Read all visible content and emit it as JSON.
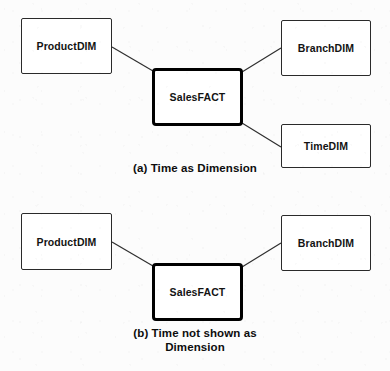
{
  "figure": {
    "background_color": "#fcfcfc",
    "line_color": "#2a2a2a",
    "fact_border_color": "#000000",
    "text_color": "#131313"
  },
  "panels": [
    {
      "id": "panel-a",
      "caption_lines": [
        "(a) Time as Dimension"
      ],
      "nodes": [
        {
          "id": "a-product",
          "label": "ProductDIM",
          "type": "dimension"
        },
        {
          "id": "a-sales",
          "label": "SalesFACT",
          "type": "fact"
        },
        {
          "id": "a-branch",
          "label": "BranchDIM",
          "type": "dimension"
        },
        {
          "id": "a-time",
          "label": "TimeDIM",
          "type": "dimension"
        }
      ],
      "edges": [
        {
          "from": "ProductDIM",
          "to": "SalesFACT"
        },
        {
          "from": "SalesFACT",
          "to": "BranchDIM"
        },
        {
          "from": "SalesFACT",
          "to": "TimeDIM"
        }
      ]
    },
    {
      "id": "panel-b",
      "caption_lines": [
        "(b) Time not shown as",
        "Dimension"
      ],
      "nodes": [
        {
          "id": "b-product",
          "label": "ProductDIM",
          "type": "dimension"
        },
        {
          "id": "b-sales",
          "label": "SalesFACT",
          "type": "fact"
        },
        {
          "id": "b-branch",
          "label": "BranchDIM",
          "type": "dimension"
        }
      ],
      "edges": [
        {
          "from": "ProductDIM",
          "to": "SalesFACT"
        },
        {
          "from": "SalesFACT",
          "to": "BranchDIM"
        }
      ]
    }
  ]
}
